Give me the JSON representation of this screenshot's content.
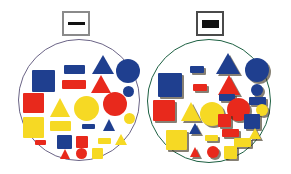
{
  "figure": {
    "background": "#ffffff",
    "palette": {
      "blue": "#1f3f8f",
      "red": "#e8291c",
      "yellow": "#f6d924",
      "shadow": "#3c321e"
    }
  },
  "badges": [
    {
      "id": "badge-flat",
      "label": "flat-bar-icon",
      "x": 62,
      "y": 11,
      "w": 28,
      "h": 25,
      "border_color": "#8a8a8a",
      "border_width": 2,
      "bar": {
        "w": 17,
        "h": 3,
        "color": "#111111"
      }
    },
    {
      "id": "badge-raised",
      "label": "thick-bar-icon",
      "x": 196,
      "y": 11,
      "w": 28,
      "h": 25,
      "border_color": "#4a4a4a",
      "border_width": 2,
      "bar": {
        "w": 17,
        "h": 8,
        "color": "#111111"
      }
    }
  ],
  "panels": [
    {
      "id": "panel-left",
      "name": "flat-shapes-circle",
      "x": 18,
      "y": 39,
      "d": 122,
      "border_color": "#6b6486",
      "border_width": 1.5,
      "style": "flat",
      "shape_count": 27,
      "shapes": [
        {
          "type": "rect",
          "color": "blue",
          "x": 45,
          "y": 25,
          "w": 21,
          "h": 9
        },
        {
          "type": "triangle",
          "color": "blue",
          "x": 73,
          "y": 15,
          "w": 22,
          "h": 19
        },
        {
          "type": "circle",
          "color": "blue",
          "x": 97,
          "y": 19,
          "w": 24,
          "h": 24
        },
        {
          "type": "square",
          "color": "blue",
          "x": 13,
          "y": 30,
          "w": 23,
          "h": 22
        },
        {
          "type": "rect",
          "color": "red",
          "x": 43,
          "y": 40,
          "w": 24,
          "h": 9
        },
        {
          "type": "triangle",
          "color": "red",
          "x": 72,
          "y": 35,
          "w": 20,
          "h": 18
        },
        {
          "type": "circle",
          "color": "blue",
          "x": 104,
          "y": 46,
          "w": 11,
          "h": 11
        },
        {
          "type": "square",
          "color": "red",
          "x": 4,
          "y": 53,
          "w": 21,
          "h": 20
        },
        {
          "type": "triangle",
          "color": "yellow",
          "x": 31,
          "y": 58,
          "w": 21,
          "h": 19
        },
        {
          "type": "circle",
          "color": "yellow",
          "x": 55,
          "y": 56,
          "w": 25,
          "h": 25
        },
        {
          "type": "circle",
          "color": "red",
          "x": 84,
          "y": 52,
          "w": 24,
          "h": 24
        },
        {
          "type": "square",
          "color": "yellow",
          "x": 4,
          "y": 77,
          "w": 21,
          "h": 21
        },
        {
          "type": "circle",
          "color": "yellow",
          "x": 105,
          "y": 73,
          "w": 11,
          "h": 11
        },
        {
          "type": "rect",
          "color": "yellow",
          "x": 31,
          "y": 81,
          "w": 21,
          "h": 10
        },
        {
          "type": "rect",
          "color": "blue",
          "x": 63,
          "y": 84,
          "w": 13,
          "h": 5
        },
        {
          "type": "triangle",
          "color": "blue",
          "x": 84,
          "y": 79,
          "w": 13,
          "h": 12
        },
        {
          "type": "rect",
          "color": "red",
          "x": 16,
          "y": 100,
          "w": 11,
          "h": 5
        },
        {
          "type": "square",
          "color": "blue",
          "x": 38,
          "y": 95,
          "w": 15,
          "h": 14
        },
        {
          "type": "square",
          "color": "red",
          "x": 57,
          "y": 96,
          "w": 12,
          "h": 12
        },
        {
          "type": "rect",
          "color": "yellow",
          "x": 79,
          "y": 98,
          "w": 13,
          "h": 6
        },
        {
          "type": "triangle",
          "color": "yellow",
          "x": 96,
          "y": 94,
          "w": 12,
          "h": 11
        },
        {
          "type": "triangle",
          "color": "red",
          "x": 41,
          "y": 109,
          "w": 11,
          "h": 10
        },
        {
          "type": "circle",
          "color": "red",
          "x": 57,
          "y": 108,
          "w": 11,
          "h": 11
        },
        {
          "type": "square",
          "color": "yellow",
          "x": 73,
          "y": 108,
          "w": 11,
          "h": 11
        }
      ]
    },
    {
      "id": "panel-right",
      "name": "raised-shapes-circle",
      "x": 147,
      "y": 39,
      "d": 124,
      "border_color": "#1d6042",
      "border_width": 1.5,
      "style": "raised",
      "shape_count": 27,
      "shapes": [
        {
          "type": "rect",
          "color": "blue",
          "x": 42,
          "y": 26,
          "w": 14,
          "h": 7
        },
        {
          "type": "triangle",
          "color": "blue",
          "x": 68,
          "y": 13,
          "w": 24,
          "h": 21
        },
        {
          "type": "circle",
          "color": "blue",
          "x": 97,
          "y": 18,
          "w": 24,
          "h": 24
        },
        {
          "type": "square",
          "color": "blue",
          "x": 10,
          "y": 33,
          "w": 24,
          "h": 24
        },
        {
          "type": "rect",
          "color": "red",
          "x": 45,
          "y": 44,
          "w": 14,
          "h": 7
        },
        {
          "type": "triangle",
          "color": "red",
          "x": 70,
          "y": 35,
          "w": 22,
          "h": 20
        },
        {
          "type": "circle",
          "color": "blue",
          "x": 103,
          "y": 44,
          "w": 12,
          "h": 12
        },
        {
          "type": "rect",
          "color": "blue",
          "x": 71,
          "y": 54,
          "w": 16,
          "h": 7
        },
        {
          "type": "rect",
          "color": "blue",
          "x": 101,
          "y": 57,
          "w": 17,
          "h": 8
        },
        {
          "type": "square",
          "color": "red",
          "x": 5,
          "y": 60,
          "w": 22,
          "h": 21
        },
        {
          "type": "triangle",
          "color": "yellow",
          "x": 33,
          "y": 62,
          "w": 21,
          "h": 19
        },
        {
          "type": "circle",
          "color": "yellow",
          "x": 52,
          "y": 62,
          "w": 24,
          "h": 24
        },
        {
          "type": "circle",
          "color": "red",
          "x": 79,
          "y": 58,
          "w": 23,
          "h": 23
        },
        {
          "type": "circle",
          "color": "yellow",
          "x": 108,
          "y": 64,
          "w": 12,
          "h": 12
        },
        {
          "type": "square",
          "color": "red",
          "x": 70,
          "y": 74,
          "w": 13,
          "h": 13
        },
        {
          "type": "square",
          "color": "blue",
          "x": 96,
          "y": 74,
          "w": 16,
          "h": 15
        },
        {
          "type": "triangle",
          "color": "blue",
          "x": 41,
          "y": 83,
          "w": 12,
          "h": 11
        },
        {
          "type": "rect",
          "color": "red",
          "x": 74,
          "y": 89,
          "w": 17,
          "h": 8
        },
        {
          "type": "square",
          "color": "yellow",
          "x": 18,
          "y": 90,
          "w": 21,
          "h": 20
        },
        {
          "type": "rect",
          "color": "yellow",
          "x": 57,
          "y": 95,
          "w": 13,
          "h": 6
        },
        {
          "type": "triangle",
          "color": "yellow",
          "x": 101,
          "y": 88,
          "w": 12,
          "h": 11
        },
        {
          "type": "rect",
          "color": "yellow",
          "x": 86,
          "y": 98,
          "w": 17,
          "h": 9
        },
        {
          "type": "triangle",
          "color": "red",
          "x": 42,
          "y": 107,
          "w": 11,
          "h": 10
        },
        {
          "type": "circle",
          "color": "red",
          "x": 59,
          "y": 106,
          "w": 12,
          "h": 12
        },
        {
          "type": "square",
          "color": "yellow",
          "x": 76,
          "y": 106,
          "w": 13,
          "h": 13
        }
      ]
    }
  ]
}
